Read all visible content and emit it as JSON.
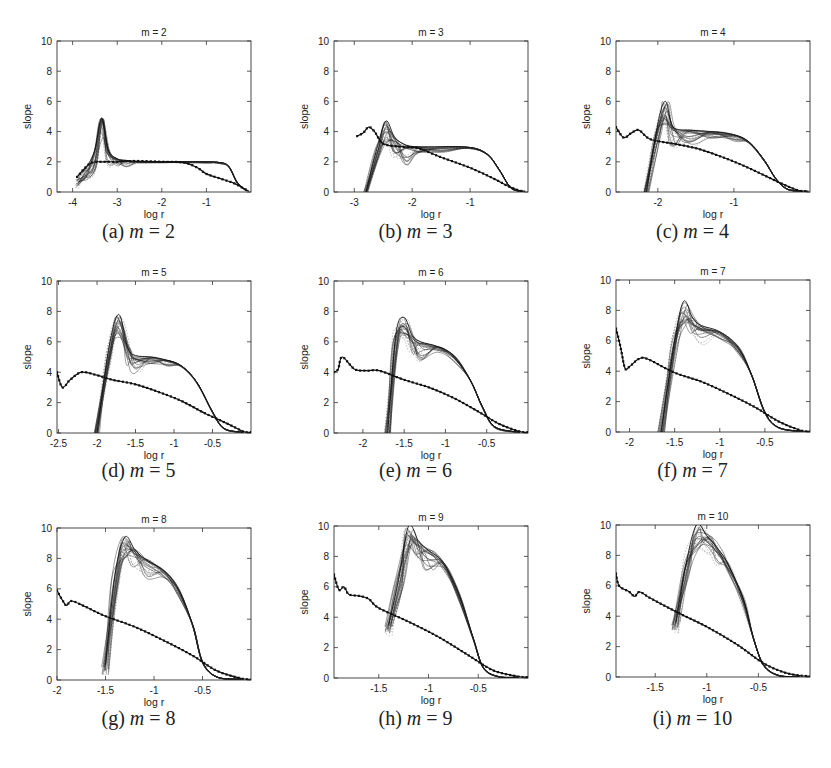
{
  "figure": {
    "panels": [
      {
        "id": "a",
        "caption_letter": "(a)",
        "caption_var": "m",
        "caption_eq": "=",
        "caption_val": "2",
        "title": "m = 2"
      },
      {
        "id": "b",
        "caption_letter": "(b)",
        "caption_var": "m",
        "caption_eq": "=",
        "caption_val": "3",
        "title": "m = 3"
      },
      {
        "id": "c",
        "caption_letter": "(c)",
        "caption_var": "m",
        "caption_eq": "=",
        "caption_val": "4",
        "title": "m = 4"
      },
      {
        "id": "d",
        "caption_letter": "(d)",
        "caption_var": "m",
        "caption_eq": "=",
        "caption_val": "5",
        "title": "m = 5"
      },
      {
        "id": "e",
        "caption_letter": "(e)",
        "caption_var": "m",
        "caption_eq": "=",
        "caption_val": "6",
        "title": "m = 6"
      },
      {
        "id": "f",
        "caption_letter": "(f)",
        "caption_var": "m",
        "caption_eq": "=",
        "caption_val": "7",
        "title": "m = 7"
      },
      {
        "id": "g",
        "caption_letter": "(g)",
        "caption_var": "m",
        "caption_eq": "=",
        "caption_val": "8",
        "title": "m = 8"
      },
      {
        "id": "h",
        "caption_letter": "(h)",
        "caption_var": "m",
        "caption_eq": "=",
        "caption_val": "9",
        "title": "m = 9"
      },
      {
        "id": "i",
        "caption_letter": "(i)",
        "caption_var": "m",
        "caption_eq": "=",
        "caption_val": "10",
        "title": "m = 10"
      }
    ]
  },
  "chart_data": [
    {
      "type": "line",
      "title": "m = 2",
      "xlabel": "log r",
      "ylabel": "slope",
      "xlim": [
        -4.35,
        0.0
      ],
      "ylim": [
        0,
        10
      ],
      "xticks": [
        -4,
        -3,
        -2,
        -1
      ],
      "xtick_labels": [
        "-4",
        "-3",
        "-2",
        "-1"
      ],
      "yticks": [
        0,
        2,
        4,
        6,
        8,
        10
      ],
      "grid": false,
      "legend": null,
      "series": [
        {
          "name": "bundle (upper envelope)",
          "style": "solid thin",
          "x": [
            -3.9,
            -3.7,
            -3.5,
            -3.35,
            -3.2,
            -3.0,
            -2.8,
            -2.5,
            -2.0,
            -1.5,
            -1.0,
            -0.7,
            -0.5,
            -0.3,
            -0.1
          ],
          "y": [
            1.0,
            1.6,
            2.8,
            4.9,
            2.8,
            2.2,
            2.1,
            2.0,
            2.0,
            2.0,
            2.0,
            1.95,
            1.7,
            0.6,
            0.1
          ]
        },
        {
          "name": "dotted curve",
          "style": "dotted heavy",
          "x": [
            -3.9,
            -3.6,
            -3.3,
            -3.0,
            -2.6,
            -2.0,
            -1.5,
            -1.2,
            -1.0,
            -0.7,
            -0.4,
            -0.2,
            -0.05
          ],
          "y": [
            1.0,
            1.9,
            2.0,
            2.0,
            2.05,
            2.0,
            1.95,
            1.6,
            1.2,
            0.9,
            0.6,
            0.3,
            0.05
          ]
        }
      ]
    },
    {
      "type": "line",
      "title": "m = 3",
      "xlabel": "log r",
      "ylabel": "slope",
      "xlim": [
        -3.35,
        0.0
      ],
      "ylim": [
        0,
        10
      ],
      "xticks": [
        -3,
        -2,
        -1
      ],
      "xtick_labels": [
        "-3",
        "-2",
        "-1"
      ],
      "yticks": [
        0,
        2,
        4,
        6,
        8,
        10
      ],
      "grid": false,
      "legend": null,
      "series": [
        {
          "name": "bundle (upper envelope)",
          "style": "solid thin",
          "x": [
            -2.8,
            -2.6,
            -2.45,
            -2.3,
            -2.1,
            -1.9,
            -1.5,
            -1.0,
            -0.7,
            -0.5,
            -0.3,
            -0.1
          ],
          "y": [
            0.0,
            3.0,
            4.7,
            3.6,
            3.1,
            3.0,
            3.0,
            2.95,
            2.5,
            1.5,
            0.3,
            0.05
          ]
        },
        {
          "name": "dotted curve",
          "style": "dotted heavy",
          "x": [
            -2.95,
            -2.85,
            -2.75,
            -2.65,
            -2.5,
            -2.2,
            -1.9,
            -1.5,
            -1.0,
            -0.6,
            -0.35,
            -0.15,
            -0.05
          ],
          "y": [
            3.7,
            3.9,
            4.3,
            4.0,
            3.2,
            3.0,
            2.9,
            2.3,
            1.6,
            0.9,
            0.4,
            0.1,
            0.05
          ]
        }
      ]
    },
    {
      "type": "line",
      "title": "m = 4",
      "xlabel": "log r",
      "ylabel": "slope",
      "xlim": [
        -2.55,
        0.0
      ],
      "ylim": [
        0,
        10
      ],
      "xticks": [
        -2,
        -1
      ],
      "xtick_labels": [
        "-2",
        "-1"
      ],
      "yticks": [
        0,
        2,
        4,
        6,
        8,
        10
      ],
      "grid": false,
      "legend": null,
      "series": [
        {
          "name": "bundle (upper envelope)",
          "style": "solid thin",
          "x": [
            -2.15,
            -2.0,
            -1.9,
            -1.8,
            -1.6,
            -1.3,
            -1.0,
            -0.8,
            -0.6,
            -0.45,
            -0.3,
            -0.1
          ],
          "y": [
            0.0,
            4.5,
            6.0,
            4.3,
            4.1,
            4.0,
            3.8,
            3.3,
            2.1,
            0.9,
            0.2,
            0.05
          ]
        },
        {
          "name": "dotted curve",
          "style": "dotted heavy",
          "x": [
            -2.55,
            -2.45,
            -2.35,
            -2.25,
            -2.1,
            -1.8,
            -1.5,
            -1.2,
            -0.9,
            -0.6,
            -0.35,
            -0.15,
            -0.02
          ],
          "y": [
            4.3,
            3.6,
            3.9,
            4.1,
            3.5,
            3.2,
            2.9,
            2.4,
            1.8,
            1.1,
            0.5,
            0.1,
            0.05
          ]
        }
      ]
    },
    {
      "type": "line",
      "title": "m = 5",
      "xlabel": "log r",
      "ylabel": "slope",
      "xlim": [
        -2.52,
        0.0
      ],
      "ylim": [
        0,
        10
      ],
      "xticks": [
        -2.5,
        -2,
        -1.5,
        -1,
        -0.5
      ],
      "xtick_labels": [
        "-2.5",
        "-2",
        "-1.5",
        "-1",
        "-0.5"
      ],
      "yticks": [
        0,
        2,
        4,
        6,
        8,
        10
      ],
      "grid": false,
      "legend": null,
      "series": [
        {
          "name": "bundle (upper envelope)",
          "style": "solid thin",
          "x": [
            -2.0,
            -1.85,
            -1.72,
            -1.6,
            -1.5,
            -1.3,
            -1.1,
            -0.9,
            -0.7,
            -0.5,
            -0.35,
            -0.1
          ],
          "y": [
            0.0,
            5.5,
            7.8,
            5.6,
            5.1,
            5.0,
            4.8,
            4.4,
            3.3,
            1.4,
            0.3,
            0.05
          ]
        },
        {
          "name": "dotted curve",
          "style": "dotted heavy",
          "x": [
            -2.52,
            -2.45,
            -2.35,
            -2.2,
            -2.0,
            -1.8,
            -1.5,
            -1.2,
            -0.9,
            -0.6,
            -0.3,
            -0.1,
            0.0
          ],
          "y": [
            4.0,
            3.0,
            3.5,
            4.0,
            3.8,
            3.5,
            3.2,
            2.7,
            2.1,
            1.3,
            0.6,
            0.1,
            0.05
          ]
        }
      ]
    },
    {
      "type": "line",
      "title": "m = 6",
      "xlabel": "log r",
      "ylabel": "slope",
      "xlim": [
        -2.35,
        0.0
      ],
      "ylim": [
        0,
        10
      ],
      "xticks": [
        -2,
        -1.5,
        -1,
        -0.5
      ],
      "xtick_labels": [
        "-2",
        "-1.5",
        "-1",
        "-0.5"
      ],
      "yticks": [
        0,
        2,
        4,
        6,
        8,
        10
      ],
      "grid": false,
      "legend": null,
      "series": [
        {
          "name": "bundle (upper envelope)",
          "style": "solid thin",
          "x": [
            -1.7,
            -1.6,
            -1.5,
            -1.4,
            -1.3,
            -1.1,
            -0.9,
            -0.7,
            -0.55,
            -0.4,
            -0.1
          ],
          "y": [
            0.0,
            6.5,
            7.6,
            6.4,
            6.0,
            5.7,
            5.1,
            3.5,
            1.7,
            0.4,
            0.05
          ]
        },
        {
          "name": "dotted curve",
          "style": "dotted heavy",
          "x": [
            -2.35,
            -2.3,
            -2.25,
            -2.1,
            -1.95,
            -1.8,
            -1.5,
            -1.2,
            -0.9,
            -0.6,
            -0.35,
            -0.1,
            0.0
          ],
          "y": [
            4.0,
            4.2,
            5.0,
            4.2,
            4.1,
            4.1,
            3.5,
            3.0,
            2.3,
            1.4,
            0.6,
            0.1,
            0.05
          ]
        }
      ]
    },
    {
      "type": "line",
      "title": "m = 7",
      "xlabel": "log r",
      "ylabel": "slope",
      "xlim": [
        -2.15,
        0.0
      ],
      "ylim": [
        0,
        10
      ],
      "xticks": [
        -2,
        -1.5,
        -1,
        -0.5
      ],
      "xtick_labels": [
        "-2",
        "-1.5",
        "-1",
        "-0.5"
      ],
      "yticks": [
        0,
        2,
        4,
        6,
        8,
        10
      ],
      "grid": false,
      "legend": null,
      "series": [
        {
          "name": "bundle (upper envelope)",
          "style": "solid thin",
          "x": [
            -1.65,
            -1.5,
            -1.4,
            -1.3,
            -1.2,
            -1.0,
            -0.8,
            -0.65,
            -0.5,
            -0.35,
            -0.1
          ],
          "y": [
            0.0,
            6.0,
            8.6,
            7.5,
            7.0,
            6.6,
            5.6,
            3.8,
            1.3,
            0.3,
            0.05
          ]
        },
        {
          "name": "dotted curve",
          "style": "dotted heavy",
          "x": [
            -2.15,
            -2.1,
            -2.05,
            -2.0,
            -1.9,
            -1.8,
            -1.5,
            -1.2,
            -0.9,
            -0.6,
            -0.35,
            -0.1,
            0.0
          ],
          "y": [
            6.8,
            5.6,
            4.2,
            4.3,
            4.8,
            4.8,
            3.9,
            3.3,
            2.5,
            1.6,
            0.7,
            0.1,
            0.05
          ]
        }
      ]
    },
    {
      "type": "line",
      "title": "m = 8",
      "xlabel": "log r",
      "ylabel": "slope",
      "xlim": [
        -2.0,
        0.0
      ],
      "ylim": [
        0,
        10
      ],
      "xticks": [
        -2,
        -1.5,
        -1,
        -0.5
      ],
      "xtick_labels": [
        "-2",
        "-1.5",
        "-1",
        "-0.5"
      ],
      "yticks": [
        0,
        2,
        4,
        6,
        8,
        10
      ],
      "grid": false,
      "legend": null,
      "series": [
        {
          "name": "bundle (upper envelope)",
          "style": "solid thin",
          "x": [
            -1.5,
            -1.4,
            -1.3,
            -1.2,
            -1.1,
            -0.9,
            -0.75,
            -0.6,
            -0.5,
            -0.35,
            -0.1
          ],
          "y": [
            1.0,
            7.0,
            9.4,
            8.6,
            8.0,
            7.2,
            6.0,
            3.6,
            1.2,
            0.2,
            0.05
          ]
        },
        {
          "name": "dotted curve",
          "style": "dotted heavy",
          "x": [
            -2.0,
            -1.95,
            -1.9,
            -1.85,
            -1.7,
            -1.5,
            -1.2,
            -0.9,
            -0.6,
            -0.35,
            -0.1,
            0.0
          ],
          "y": [
            5.9,
            5.3,
            4.9,
            5.2,
            4.8,
            4.2,
            3.5,
            2.6,
            1.6,
            0.6,
            0.1,
            0.05
          ]
        }
      ]
    },
    {
      "type": "line",
      "title": "m = 9",
      "xlabel": "log r",
      "ylabel": "slope",
      "xlim": [
        -1.95,
        0.0
      ],
      "ylim": [
        0,
        10
      ],
      "xticks": [
        -1.5,
        -1,
        -0.5
      ],
      "xtick_labels": [
        "-1.5",
        "-1",
        "-0.5"
      ],
      "yticks": [
        0,
        2,
        4,
        6,
        8,
        10
      ],
      "grid": false,
      "legend": null,
      "series": [
        {
          "name": "bundle (upper envelope)",
          "style": "solid thin",
          "x": [
            -1.4,
            -1.3,
            -1.2,
            -1.1,
            -1.0,
            -0.85,
            -0.7,
            -0.55,
            -0.45,
            -0.3,
            -0.1
          ],
          "y": [
            3.5,
            6.5,
            10.0,
            9.0,
            8.4,
            7.6,
            5.6,
            2.6,
            0.7,
            0.1,
            0.05
          ]
        },
        {
          "name": "dotted curve",
          "style": "dotted heavy",
          "x": [
            -1.95,
            -1.9,
            -1.85,
            -1.8,
            -1.7,
            -1.6,
            -1.5,
            -1.2,
            -0.9,
            -0.6,
            -0.35,
            -0.1,
            0.0
          ],
          "y": [
            6.8,
            5.8,
            6.0,
            5.5,
            5.4,
            5.2,
            4.6,
            3.7,
            2.7,
            1.5,
            0.5,
            0.1,
            0.05
          ]
        }
      ]
    },
    {
      "type": "line",
      "title": "m = 10",
      "xlabel": "log r",
      "ylabel": "slope",
      "xlim": [
        -1.88,
        0.0
      ],
      "ylim": [
        0,
        10
      ],
      "xticks": [
        -1.5,
        -1,
        -0.5
      ],
      "xtick_labels": [
        "-1.5",
        "-1",
        "-0.5"
      ],
      "yticks": [
        0,
        2,
        4,
        6,
        8,
        10
      ],
      "grid": false,
      "legend": null,
      "series": [
        {
          "name": "bundle (upper envelope)",
          "style": "solid thin",
          "x": [
            -1.3,
            -1.2,
            -1.1,
            -1.0,
            -0.9,
            -0.8,
            -0.65,
            -0.55,
            -0.45,
            -0.3,
            -0.1
          ],
          "y": [
            3.6,
            7.5,
            10.0,
            9.3,
            8.5,
            7.5,
            5.2,
            2.6,
            0.8,
            0.1,
            0.05
          ]
        },
        {
          "name": "dotted curve",
          "style": "dotted heavy",
          "x": [
            -1.88,
            -1.85,
            -1.75,
            -1.7,
            -1.65,
            -1.55,
            -1.3,
            -1.0,
            -0.7,
            -0.45,
            -0.25,
            -0.1,
            0.0
          ],
          "y": [
            6.8,
            6.0,
            5.6,
            5.3,
            5.6,
            5.2,
            4.3,
            3.3,
            2.1,
            0.9,
            0.3,
            0.1,
            0.05
          ]
        }
      ]
    }
  ]
}
